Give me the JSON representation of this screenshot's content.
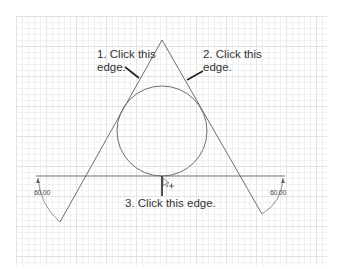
{
  "diagram": {
    "grid": {
      "x0": 16,
      "y0": 16,
      "x1": 327,
      "y1": 265,
      "minor": 6,
      "major": 30,
      "minor_color": "#f0f0f0",
      "major_color": "#e2e2e2"
    },
    "triangle": {
      "apex": [
        162,
        40
      ],
      "left_end": [
        60,
        222
      ],
      "right_end": [
        262,
        214
      ],
      "color": "#6e6e6e"
    },
    "baseline": {
      "x0": 36,
      "x1": 285,
      "y": 176,
      "color": "#6e6e6e"
    },
    "circle": {
      "cx": 162,
      "cy": 131,
      "r": 45,
      "color": "#6e6e6e"
    },
    "callouts": [
      {
        "id": "edge1",
        "text_lines": [
          "1. Click this",
          "edge."
        ],
        "x": 97,
        "y": 48,
        "leader": [
          [
            125,
            67
          ],
          [
            139,
            78
          ]
        ]
      },
      {
        "id": "edge2",
        "text_lines": [
          "2. Click this",
          "edge."
        ],
        "x": 203,
        "y": 48,
        "leader": [
          [
            203,
            71
          ],
          [
            187,
            80
          ]
        ]
      },
      {
        "id": "edge3",
        "text_lines": [
          "3. Click this edge."
        ],
        "x": 125,
        "y": 197,
        "leader": [
          [
            162,
            176
          ],
          [
            162,
            196
          ]
        ]
      }
    ],
    "dimensions": [
      {
        "id": "left-angle",
        "value": "60.00",
        "x": 34,
        "y": 192
      },
      {
        "id": "right-angle",
        "value": "60.00",
        "x": 270,
        "y": 192
      }
    ],
    "cursor": {
      "name": "move-cursor",
      "x": 163,
      "y": 178
    }
  }
}
